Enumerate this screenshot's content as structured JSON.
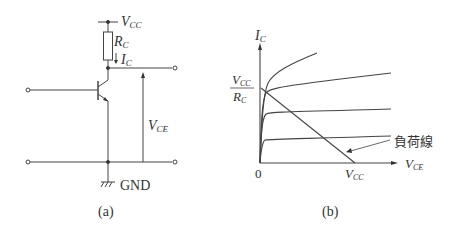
{
  "circuit_a": {
    "caption": "(a)",
    "labels": {
      "vcc_main": "V",
      "vcc_sub": "CC",
      "rc_main": "R",
      "rc_sub": "C",
      "ic_main": "I",
      "ic_sub": "C",
      "vce_main": "V",
      "vce_sub": "CE",
      "gnd": "GND"
    }
  },
  "graph_b": {
    "caption": "(b)",
    "labels": {
      "y_axis_main": "I",
      "y_axis_sub": "C",
      "x_axis_main": "V",
      "x_axis_sub": "CE",
      "origin": "0",
      "y_intercept_num_main": "V",
      "y_intercept_num_sub": "CC",
      "y_intercept_den_main": "R",
      "y_intercept_den_sub": "C",
      "x_intercept_main": "V",
      "x_intercept_sub": "CC",
      "load_line": "負荷線"
    }
  },
  "colors": {
    "line": "#444444",
    "text": "#333333",
    "background": "#ffffff"
  }
}
